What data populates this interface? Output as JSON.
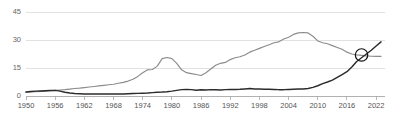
{
  "chart_data": {
    "type": "line",
    "title": "",
    "subtitle": "",
    "xlabel": "",
    "ylabel": "",
    "xlim": [
      1950,
      2023
    ],
    "ylim": [
      0,
      45
    ],
    "grid": true,
    "legend": false,
    "y_ticks": [
      0,
      15,
      30,
      45
    ],
    "y_tick_labels": [
      "0",
      "15",
      "30",
      "45"
    ],
    "x_ticks": [
      1950,
      1956,
      1962,
      1968,
      1974,
      1980,
      1986,
      1992,
      1998,
      2004,
      2010,
      2016,
      2022
    ],
    "x_tick_labels": [
      "1950",
      "1956",
      "1962",
      "1968",
      "1974",
      "1980",
      "1986",
      "1992",
      "1998",
      "2004",
      "2010",
      "2016",
      "2022"
    ],
    "colors": {
      "series_gray": "#8c8c8c",
      "series_dark": "#2b2b2b",
      "gridline": "#d9d9d9",
      "axis": "#a8a8a8",
      "marker": "#111111",
      "background": "#ffffff",
      "tick_label": "#555555"
    },
    "annotations": [
      {
        "name": "crossover-marker",
        "shape": "circle-with-x",
        "x": 2019,
        "y": 22.0,
        "label": ""
      }
    ],
    "series": [
      {
        "name": "series-gray",
        "color": "#8c8c8c",
        "x": [
          1950,
          1951,
          1952,
          1953,
          1954,
          1955,
          1956,
          1957,
          1958,
          1959,
          1960,
          1961,
          1962,
          1963,
          1964,
          1965,
          1966,
          1967,
          1968,
          1969,
          1970,
          1971,
          1972,
          1973,
          1974,
          1975,
          1976,
          1977,
          1978,
          1979,
          1980,
          1981,
          1982,
          1983,
          1984,
          1985,
          1986,
          1987,
          1988,
          1989,
          1990,
          1991,
          1992,
          1993,
          1994,
          1995,
          1996,
          1997,
          1998,
          1999,
          2000,
          2001,
          2002,
          2003,
          2004,
          2005,
          2006,
          2007,
          2008,
          2009,
          2010,
          2011,
          2012,
          2013,
          2014,
          2015,
          2016,
          2017,
          2018,
          2019,
          2020,
          2021,
          2022,
          2023
        ],
        "values": [
          2.0,
          2.2,
          2.3,
          2.5,
          2.6,
          2.8,
          3.0,
          3.2,
          3.4,
          3.7,
          4.0,
          4.2,
          4.5,
          4.8,
          5.1,
          5.4,
          5.7,
          6.0,
          6.3,
          6.8,
          7.3,
          8.0,
          9.0,
          10.5,
          12.5,
          14.0,
          14.2,
          16.0,
          20.0,
          20.6,
          20.0,
          17.5,
          14.0,
          12.5,
          12.0,
          11.5,
          11.0,
          12.5,
          14.5,
          16.5,
          17.5,
          18.0,
          19.5,
          20.5,
          21.0,
          22.0,
          23.5,
          24.5,
          25.5,
          26.5,
          27.5,
          28.5,
          29.0,
          30.5,
          31.5,
          33.0,
          33.8,
          34.0,
          33.8,
          32.0,
          29.5,
          28.5,
          28.0,
          27.0,
          26.0,
          25.0,
          23.5,
          22.5,
          22.0,
          21.8,
          21.5,
          21.3,
          21.2,
          21.2
        ]
      },
      {
        "name": "series-dark",
        "color": "#2b2b2b",
        "x": [
          1950,
          1951,
          1952,
          1953,
          1954,
          1955,
          1956,
          1957,
          1958,
          1959,
          1960,
          1961,
          1962,
          1963,
          1964,
          1965,
          1966,
          1967,
          1968,
          1969,
          1970,
          1971,
          1972,
          1973,
          1974,
          1975,
          1976,
          1977,
          1978,
          1979,
          1980,
          1981,
          1982,
          1983,
          1984,
          1985,
          1986,
          1987,
          1988,
          1989,
          1990,
          1991,
          1992,
          1993,
          1994,
          1995,
          1996,
          1997,
          1998,
          1999,
          2000,
          2001,
          2002,
          2003,
          2004,
          2005,
          2006,
          2007,
          2008,
          2009,
          2010,
          2011,
          2012,
          2013,
          2014,
          2015,
          2016,
          2017,
          2018,
          2019,
          2020,
          2021,
          2022,
          2023
        ],
        "values": [
          2.1,
          2.4,
          2.6,
          2.7,
          2.8,
          2.9,
          3.0,
          2.6,
          2.0,
          1.6,
          1.3,
          1.2,
          1.1,
          1.1,
          1.1,
          1.1,
          1.1,
          1.1,
          1.1,
          1.1,
          1.1,
          1.2,
          1.3,
          1.4,
          1.5,
          1.6,
          1.8,
          2.0,
          2.1,
          2.3,
          2.6,
          3.0,
          3.4,
          3.5,
          3.4,
          3.1,
          3.3,
          3.2,
          3.4,
          3.3,
          3.2,
          3.4,
          3.5,
          3.5,
          3.6,
          3.8,
          4.0,
          3.8,
          3.7,
          3.6,
          3.6,
          3.5,
          3.4,
          3.4,
          3.5,
          3.6,
          3.7,
          3.8,
          4.0,
          4.6,
          5.5,
          6.6,
          7.5,
          8.5,
          10.0,
          11.5,
          13.0,
          15.5,
          18.5,
          20.5,
          22.5,
          24.5,
          26.8,
          29.0
        ]
      }
    ]
  }
}
